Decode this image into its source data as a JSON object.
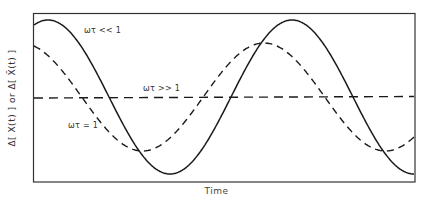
{
  "chart_data": {
    "type": "line",
    "title": "",
    "xlabel": "Time",
    "ylabel": "Δ[ X(t) ] or Δ[ X̄(t) ]",
    "grid": false,
    "legend": "inline annotations",
    "x_range": [
      0,
      1
    ],
    "y_range": [
      -1,
      1
    ],
    "ticks": {
      "x": [],
      "y": []
    },
    "series": [
      {
        "name": "ωτ << 1",
        "style": "solid",
        "description": "Large-amplitude sinusoid; in phase with driving signal",
        "points": [
          [
            0.0,
            0.81
          ],
          [
            0.04,
            0.92
          ],
          [
            0.13,
            0.53
          ],
          [
            0.19,
            0.0
          ],
          [
            0.31,
            -0.93
          ],
          [
            0.43,
            0.0
          ],
          [
            0.52,
            0.92
          ],
          [
            0.6,
            0.53
          ],
          [
            0.84,
            0.0
          ],
          [
            1.0,
            -0.86
          ]
        ]
      },
      {
        "name": "ωτ = 1",
        "style": "dashed",
        "description": "Reduced-amplitude sinusoid, phase lagged",
        "points": [
          [
            0.0,
            0.58
          ],
          [
            0.11,
            0.0
          ],
          [
            0.28,
            -0.65
          ],
          [
            0.44,
            0.0
          ],
          [
            0.6,
            0.65
          ],
          [
            0.76,
            0.0
          ],
          [
            0.93,
            -0.62
          ],
          [
            1.0,
            -0.47
          ]
        ]
      },
      {
        "name": "ωτ >> 1",
        "style": "dashed",
        "description": "Flat line near zero",
        "points": [
          [
            0.0,
            0.0
          ],
          [
            1.0,
            0.01
          ]
        ]
      }
    ],
    "annotations": [
      "ωτ << 1",
      "ωτ >> 1",
      "ωτ = 1"
    ]
  },
  "labels": {
    "xlabel": "Time",
    "ylabel": "Δ[ X(t) ] or Δ[ X̄(t) ]",
    "curve_slow": "ωτ << 1",
    "curve_fast": "ωτ >> 1",
    "curve_mid": "ωτ = 1"
  }
}
